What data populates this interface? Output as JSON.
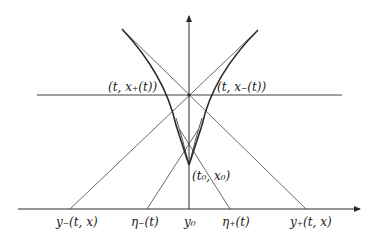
{
  "diagram": {
    "type": "characteristics-cusp-diagram",
    "colors": {
      "stroke": "#2a2a2a",
      "background": "#ffffff"
    },
    "labels": {
      "point_plus": "(t, x₊(t))",
      "point_minus": "(t, x₋(t))",
      "origin_point": "(t₀, x₀)",
      "y_minus": "y₋(t, x)",
      "eta_minus": "η₋(t)",
      "y0": "y₀",
      "eta_plus": "η₊(t)",
      "y_plus": "y₊(t, x)"
    }
  }
}
